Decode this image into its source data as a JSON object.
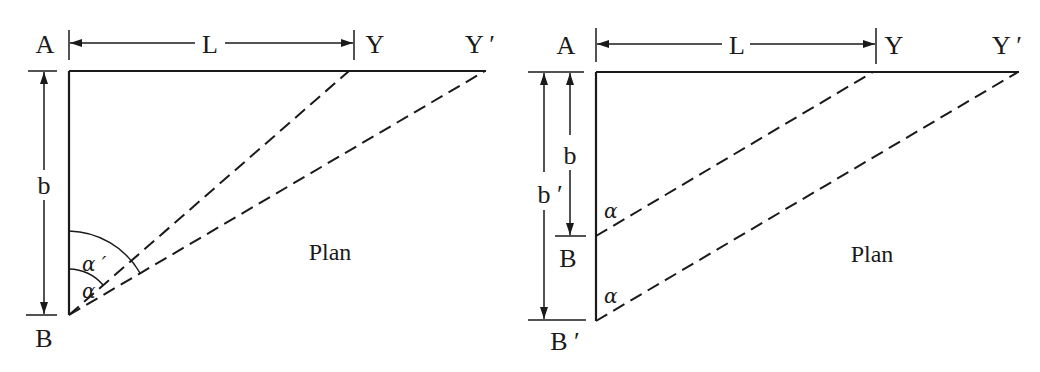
{
  "figure": {
    "left_panel": {
      "labels": {
        "point_a": "A",
        "point_b": "B",
        "point_y": "Y",
        "point_y_prime": "Y ′",
        "length": "L",
        "breadth": "b",
        "angle": "α",
        "angle_prime": "α ′",
        "view": "Plan"
      }
    },
    "right_panel": {
      "labels": {
        "point_a": "A",
        "point_b": "B",
        "point_b_prime": "B ′",
        "point_y": "Y",
        "point_y_prime": "Y ′",
        "length": "L",
        "breadth": "b",
        "breadth_prime": "b ′",
        "angle_1": "α",
        "angle_2": "α",
        "view": "Plan"
      }
    },
    "colors": {
      "ink": "#1a1a1a",
      "background": "#ffffff"
    }
  }
}
